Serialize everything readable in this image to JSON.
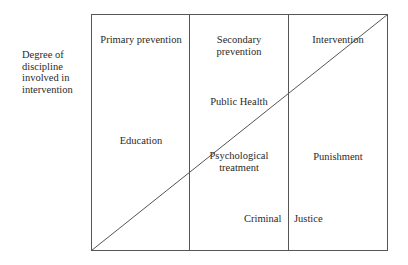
{
  "axis_label": [
    "Degree of",
    "discipline",
    "involved in",
    "intervention"
  ],
  "columns": [
    {
      "header": "Primary prevention"
    },
    {
      "header": "Secondary",
      "header_line2": "prevention"
    },
    {
      "header": "Intervention"
    }
  ],
  "regions": {
    "public_health": "Public Health",
    "education": "Education",
    "psychological_1": "Psychological",
    "psychological_2": "treatment",
    "punishment": "Punishment",
    "criminal": "Criminal",
    "justice": "Justice"
  },
  "colors": {
    "line": "#555555",
    "text": "#2a2a2a"
  }
}
